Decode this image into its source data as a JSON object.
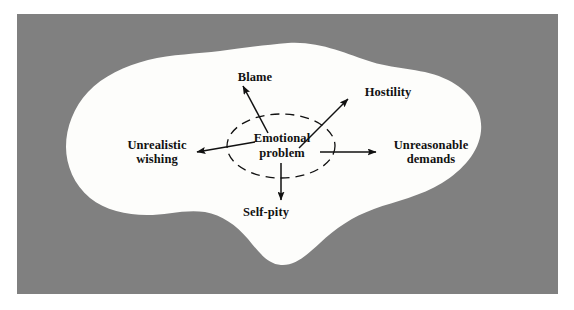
{
  "figure": {
    "type": "concept-diagram",
    "background_color": "#ffffff",
    "field_color": "#808080",
    "blob_color": "#fdfdfb",
    "ink_color": "#111111"
  },
  "center": {
    "name": "emotional-problem",
    "line1": "Emotional",
    "line2": "problem",
    "shape": "dashed-ellipse"
  },
  "nodes": [
    {
      "id": "blame",
      "line1": "Blame",
      "line2": "",
      "direction": "up-left",
      "arrow": "outward"
    },
    {
      "id": "hostility",
      "line1": "Hostility",
      "line2": "",
      "direction": "up-right",
      "arrow": "outward"
    },
    {
      "id": "unrealistic-wishing",
      "line1": "Unrealistic",
      "line2": "wishing",
      "direction": "left",
      "arrow": "outward"
    },
    {
      "id": "unreasonable-demands",
      "line1": "Unreasonable",
      "line2": "demands",
      "direction": "right",
      "arrow": "outward"
    },
    {
      "id": "self-pity",
      "line1": "Self-pity",
      "line2": "",
      "direction": "down",
      "arrow": "outward"
    }
  ]
}
